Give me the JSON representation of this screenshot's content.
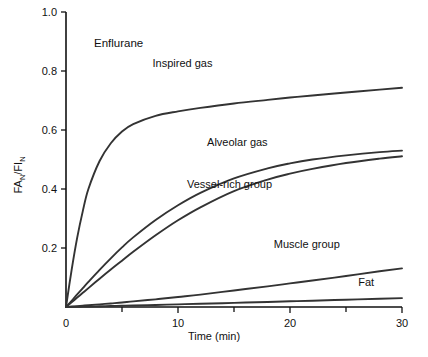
{
  "chart_data": {
    "type": "line",
    "title": "Enflurane",
    "xlabel": "Time (min)",
    "ylabel": "FA/FI",
    "ylabel_parts": {
      "a": "FA",
      "a_sub": "N",
      "slash": "/",
      "b": "FI",
      "b_sub": "N"
    },
    "xlim": [
      0,
      30
    ],
    "ylim": [
      0,
      1.0
    ],
    "grid": false,
    "legend": "inline-annotations",
    "xticks": [
      0,
      10,
      20,
      30
    ],
    "xtick_labels": [
      "0",
      "10",
      "20",
      "30"
    ],
    "xminor_ticks": [
      5,
      15,
      25
    ],
    "yticks": [
      0.2,
      0.4,
      0.6,
      0.8,
      1.0
    ],
    "ytick_labels": [
      "0.2",
      "0.4",
      "0.6",
      "0.8",
      "1.0"
    ],
    "x": [
      0,
      0.5,
      1,
      1.5,
      2,
      3,
      4,
      5,
      6,
      8,
      10,
      12,
      15,
      18,
      20,
      22,
      25,
      28,
      30
    ],
    "series": [
      {
        "name": "Inspired gas",
        "label": "Inspired gas",
        "label_x": 10.4,
        "label_y": 0.815,
        "values": [
          0,
          0.125,
          0.235,
          0.325,
          0.4,
          0.495,
          0.555,
          0.595,
          0.62,
          0.648,
          0.663,
          0.675,
          0.69,
          0.702,
          0.71,
          0.717,
          0.727,
          0.737,
          0.743
        ]
      },
      {
        "name": "Alveolar gas",
        "label": "Alveolar gas",
        "label_x": 15.3,
        "label_y": 0.545,
        "values": [
          0,
          0.021,
          0.043,
          0.064,
          0.085,
          0.126,
          0.165,
          0.202,
          0.236,
          0.295,
          0.345,
          0.387,
          0.436,
          0.47,
          0.487,
          0.5,
          0.514,
          0.525,
          0.53
        ]
      },
      {
        "name": "Vessel-rich group",
        "label": "Vessel-rich group",
        "label_x": 14.6,
        "label_y": 0.405,
        "values": [
          0,
          0.016,
          0.032,
          0.048,
          0.064,
          0.096,
          0.127,
          0.157,
          0.187,
          0.243,
          0.294,
          0.338,
          0.393,
          0.432,
          0.452,
          0.468,
          0.488,
          0.503,
          0.511
        ]
      },
      {
        "name": "Muscle group",
        "label": "Muscle group",
        "label_x": 21.5,
        "label_y": 0.2,
        "values": [
          0,
          0.0015,
          0.003,
          0.0045,
          0.006,
          0.009,
          0.012,
          0.015,
          0.019,
          0.026,
          0.034,
          0.042,
          0.056,
          0.07,
          0.08,
          0.09,
          0.105,
          0.121,
          0.131
        ]
      },
      {
        "name": "Fat",
        "label": "Fat",
        "label_x": 26.8,
        "label_y": 0.072,
        "values": [
          0,
          0.0004,
          0.0008,
          0.0012,
          0.0016,
          0.0025,
          0.0034,
          0.0043,
          0.0052,
          0.007,
          0.009,
          0.011,
          0.014,
          0.0172,
          0.0193,
          0.0214,
          0.0246,
          0.0278,
          0.03
        ]
      }
    ]
  },
  "style": {
    "curve_color": "#333333",
    "axis_color": "#111111",
    "text_color": "#111111",
    "background": "#ffffff"
  }
}
